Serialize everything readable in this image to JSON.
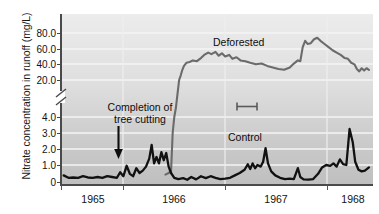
{
  "figure": {
    "title": "",
    "y_axis_title": "Nitrate concentration in runoff (mg/L)",
    "x_axis_title": ""
  },
  "axes": {
    "y_tick_labels": [
      "80.0",
      "60.0",
      "40.0",
      "20.0",
      "4.0",
      "3.0",
      "2.0",
      "1.0",
      "0"
    ],
    "x_tick_labels": [
      "1965",
      "1966",
      "1967",
      "1968"
    ],
    "axis_break": "broken-axis-glyph"
  },
  "annotations": {
    "completion_line1": "Completion of",
    "completion_line2": "tree cutting",
    "deforested": "Deforested",
    "control": "Control"
  },
  "colors": {
    "deforested_line": "#6b6b6b",
    "control_line": "#111111",
    "axis": "#4a4a4a",
    "plot_background_top": "#ececec",
    "plot_background_bottom": "#bfbfbf",
    "gridline": "#f2f2f2",
    "text": "#111111"
  },
  "chart_data": {
    "type": "line",
    "title": "",
    "xlabel": "",
    "ylabel": "Nitrate concentration in runoff (mg/L)",
    "grid": true,
    "legend": "inline-labels",
    "x_axis": {
      "tick_labels": [
        "1965",
        "1966",
        "1967",
        "1968"
      ],
      "tick_values": [
        1965.0,
        1966.0,
        1967.0,
        1968.0
      ],
      "range": [
        1964.6,
        1968.45
      ],
      "note": "tick label is centered within the year it names"
    },
    "y_axis": {
      "broken": true,
      "lower_segment": {
        "range": [
          0,
          4.0
        ],
        "ticks": [
          0,
          1.0,
          2.0,
          3.0,
          4.0
        ]
      },
      "upper_segment": {
        "range": [
          20.0,
          80.0
        ],
        "ticks": [
          20.0,
          40.0,
          60.0,
          80.0
        ]
      },
      "units": "mg/L"
    },
    "series": [
      {
        "name": "Deforested",
        "color": "#6b6b6b",
        "points": [
          [
            1965.88,
            0.4
          ],
          [
            1965.92,
            0.5
          ],
          [
            1965.95,
            0.6
          ],
          [
            1965.97,
            3.0
          ],
          [
            1965.99,
            4.0
          ],
          [
            1966.01,
            8.0
          ],
          [
            1966.03,
            14.0
          ],
          [
            1966.05,
            20.0
          ],
          [
            1966.07,
            26.0
          ],
          [
            1966.09,
            33.0
          ],
          [
            1966.11,
            38.0
          ],
          [
            1966.14,
            42.0
          ],
          [
            1966.18,
            43.0
          ],
          [
            1966.22,
            45.0
          ],
          [
            1966.27,
            44.0
          ],
          [
            1966.32,
            48.0
          ],
          [
            1966.36,
            52.0
          ],
          [
            1966.41,
            55.0
          ],
          [
            1966.45,
            53.0
          ],
          [
            1966.5,
            56.0
          ],
          [
            1966.54,
            51.0
          ],
          [
            1966.58,
            54.0
          ],
          [
            1966.62,
            50.0
          ],
          [
            1966.67,
            52.0
          ],
          [
            1966.71,
            47.0
          ],
          [
            1966.76,
            49.0
          ],
          [
            1966.81,
            45.0
          ],
          [
            1966.87,
            44.0
          ],
          [
            1966.93,
            42.0
          ],
          [
            1967.0,
            40.0
          ],
          [
            1967.07,
            41.0
          ],
          [
            1967.14,
            38.0
          ],
          [
            1967.21,
            36.0
          ],
          [
            1967.28,
            34.0
          ],
          [
            1967.35,
            33.0
          ],
          [
            1967.42,
            36.0
          ],
          [
            1967.47,
            41.0
          ],
          [
            1967.52,
            45.0
          ],
          [
            1967.55,
            44.0
          ],
          [
            1967.58,
            62.0
          ],
          [
            1967.61,
            70.0
          ],
          [
            1967.64,
            66.0
          ],
          [
            1967.68,
            67.0
          ],
          [
            1967.72,
            72.0
          ],
          [
            1967.76,
            74.0
          ],
          [
            1967.8,
            70.0
          ],
          [
            1967.85,
            66.0
          ],
          [
            1967.9,
            62.0
          ],
          [
            1967.95,
            58.0
          ],
          [
            1968.0,
            55.0
          ],
          [
            1968.05,
            52.0
          ],
          [
            1968.1,
            48.0
          ],
          [
            1968.14,
            47.0
          ],
          [
            1968.18,
            42.0
          ],
          [
            1968.22,
            40.0
          ],
          [
            1968.25,
            34.0
          ],
          [
            1968.28,
            31.0
          ],
          [
            1968.31,
            35.0
          ],
          [
            1968.34,
            32.0
          ],
          [
            1968.37,
            35.0
          ],
          [
            1968.4,
            33.0
          ]
        ]
      },
      {
        "name": "Control",
        "color": "#111111",
        "points": [
          [
            1964.62,
            0.35
          ],
          [
            1964.68,
            0.2
          ],
          [
            1964.74,
            0.22
          ],
          [
            1964.8,
            0.2
          ],
          [
            1964.86,
            0.3
          ],
          [
            1964.92,
            0.22
          ],
          [
            1964.98,
            0.2
          ],
          [
            1965.04,
            0.25
          ],
          [
            1965.1,
            0.2
          ],
          [
            1965.16,
            0.3
          ],
          [
            1965.22,
            0.25
          ],
          [
            1965.28,
            0.2
          ],
          [
            1965.32,
            0.55
          ],
          [
            1965.36,
            0.3
          ],
          [
            1965.4,
            0.95
          ],
          [
            1965.44,
            0.45
          ],
          [
            1965.48,
            0.3
          ],
          [
            1965.52,
            0.8
          ],
          [
            1965.56,
            0.5
          ],
          [
            1965.6,
            0.65
          ],
          [
            1965.64,
            0.9
          ],
          [
            1965.68,
            1.4
          ],
          [
            1965.71,
            2.25
          ],
          [
            1965.74,
            1.1
          ],
          [
            1965.77,
            1.5
          ],
          [
            1965.8,
            1.1
          ],
          [
            1965.83,
            1.8
          ],
          [
            1965.86,
            1.3
          ],
          [
            1965.89,
            1.75
          ],
          [
            1965.92,
            0.9
          ],
          [
            1965.95,
            0.5
          ],
          [
            1965.99,
            0.2
          ],
          [
            1966.04,
            0.12
          ],
          [
            1966.1,
            0.18
          ],
          [
            1966.15,
            0.08
          ],
          [
            1966.2,
            0.25
          ],
          [
            1966.26,
            0.1
          ],
          [
            1966.32,
            0.3
          ],
          [
            1966.38,
            0.18
          ],
          [
            1966.44,
            0.3
          ],
          [
            1966.5,
            0.2
          ],
          [
            1966.56,
            0.12
          ],
          [
            1966.62,
            0.15
          ],
          [
            1966.68,
            0.2
          ],
          [
            1966.74,
            0.35
          ],
          [
            1966.8,
            0.5
          ],
          [
            1966.86,
            0.7
          ],
          [
            1966.9,
            1.05
          ],
          [
            1966.93,
            0.75
          ],
          [
            1966.96,
            1.1
          ],
          [
            1966.99,
            0.8
          ],
          [
            1967.02,
            1.0
          ],
          [
            1967.06,
            0.9
          ],
          [
            1967.09,
            1.2
          ],
          [
            1967.12,
            2.05
          ],
          [
            1967.15,
            1.1
          ],
          [
            1967.19,
            0.6
          ],
          [
            1967.24,
            0.35
          ],
          [
            1967.3,
            0.2
          ],
          [
            1967.36,
            0.12
          ],
          [
            1967.42,
            0.15
          ],
          [
            1967.47,
            0.12
          ],
          [
            1967.52,
            0.8
          ],
          [
            1967.55,
            0.25
          ],
          [
            1967.59,
            0.1
          ],
          [
            1967.65,
            0.08
          ],
          [
            1967.71,
            0.12
          ],
          [
            1967.77,
            0.45
          ],
          [
            1967.82,
            0.85
          ],
          [
            1967.87,
            1.0
          ],
          [
            1967.92,
            0.95
          ],
          [
            1967.96,
            1.1
          ],
          [
            1968.0,
            0.9
          ],
          [
            1968.04,
            1.35
          ],
          [
            1968.08,
            1.05
          ],
          [
            1968.12,
            1.0
          ],
          [
            1968.16,
            3.25
          ],
          [
            1968.2,
            2.4
          ],
          [
            1968.23,
            1.2
          ],
          [
            1968.27,
            0.7
          ],
          [
            1968.31,
            0.6
          ],
          [
            1968.35,
            0.65
          ],
          [
            1968.4,
            0.85
          ]
        ]
      }
    ],
    "annotations": [
      {
        "text": "Completion of tree cutting",
        "type": "arrow-annotation",
        "x": 1965.4,
        "y": 1.0
      },
      {
        "text": "Deforested",
        "type": "series-label",
        "x": 1966.85,
        "y": 65.0
      },
      {
        "text": "Control",
        "type": "series-label",
        "x": 1967.05,
        "y": 2.6
      }
    ]
  }
}
